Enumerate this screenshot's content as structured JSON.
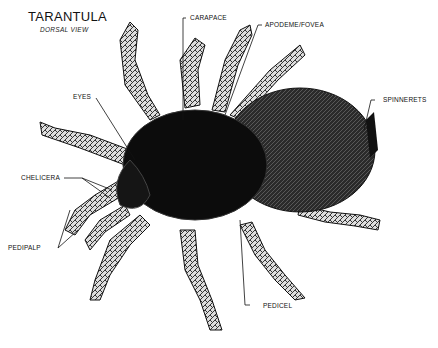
{
  "diagram": {
    "title": "TARANTULA",
    "subtitle": "DORSAL VIEW",
    "labels": {
      "carapace": "CARAPACE",
      "apodeme": "APODEME/FOVEA",
      "spinnerets": "SPINNERETS",
      "eyes": "EYES",
      "chelicera": "CHELICERA",
      "pedipalp": "PEDIPALP",
      "pedicel": "PEDICEL"
    }
  }
}
